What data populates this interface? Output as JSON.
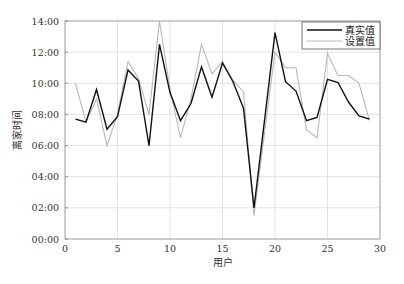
{
  "chart_data": {
    "type": "line",
    "title": "",
    "xlabel": "用户",
    "ylabel": "离家时间",
    "xlim": [
      0,
      30
    ],
    "ylim": [
      0,
      14
    ],
    "xticks": [
      0,
      5,
      10,
      15,
      20,
      25,
      30
    ],
    "xtick_labels": [
      "0",
      "5",
      "10",
      "15",
      "20",
      "25",
      "30"
    ],
    "yticks": [
      0,
      2,
      4,
      6,
      8,
      10,
      12,
      14
    ],
    "ytick_labels": [
      "00:00",
      "02:00",
      "04:00",
      "06:00",
      "08:00",
      "10:00",
      "12:00",
      "14:00"
    ],
    "grid": true,
    "legend_position": "upper right",
    "x": [
      1,
      2,
      3,
      4,
      5,
      6,
      7,
      8,
      9,
      10,
      11,
      12,
      13,
      14,
      15,
      16,
      17,
      18,
      19,
      20,
      21,
      22,
      23,
      24,
      25,
      26,
      27,
      28,
      29
    ],
    "series": [
      {
        "name": "真实值",
        "color": "#111111",
        "values": [
          7.7,
          7.5,
          9.6,
          7.05,
          7.85,
          10.85,
          10.15,
          6.0,
          12.5,
          9.4,
          7.6,
          8.7,
          11.05,
          9.1,
          11.3,
          10.1,
          8.4,
          2.0,
          7.6,
          13.25,
          10.1,
          9.5,
          7.6,
          7.8,
          10.25,
          10.05,
          8.8,
          7.9,
          7.7
        ]
      },
      {
        "name": "设置值",
        "color": "#b8b8b8",
        "values": [
          10.0,
          7.5,
          9.0,
          6.0,
          8.0,
          11.4,
          10.3,
          8.0,
          14.0,
          9.6,
          6.5,
          9.0,
          12.5,
          10.6,
          11.4,
          10.2,
          9.45,
          1.5,
          6.8,
          12.0,
          11.0,
          11.0,
          7.0,
          6.5,
          11.9,
          10.5,
          10.5,
          10.0,
          7.6
        ]
      }
    ]
  },
  "legend": {
    "items": [
      {
        "label": "真实值",
        "color": "#111111"
      },
      {
        "label": "设置值",
        "color": "#b8b8b8"
      }
    ]
  },
  "axes": {
    "x_title": "用户",
    "y_title": "离家时间"
  }
}
